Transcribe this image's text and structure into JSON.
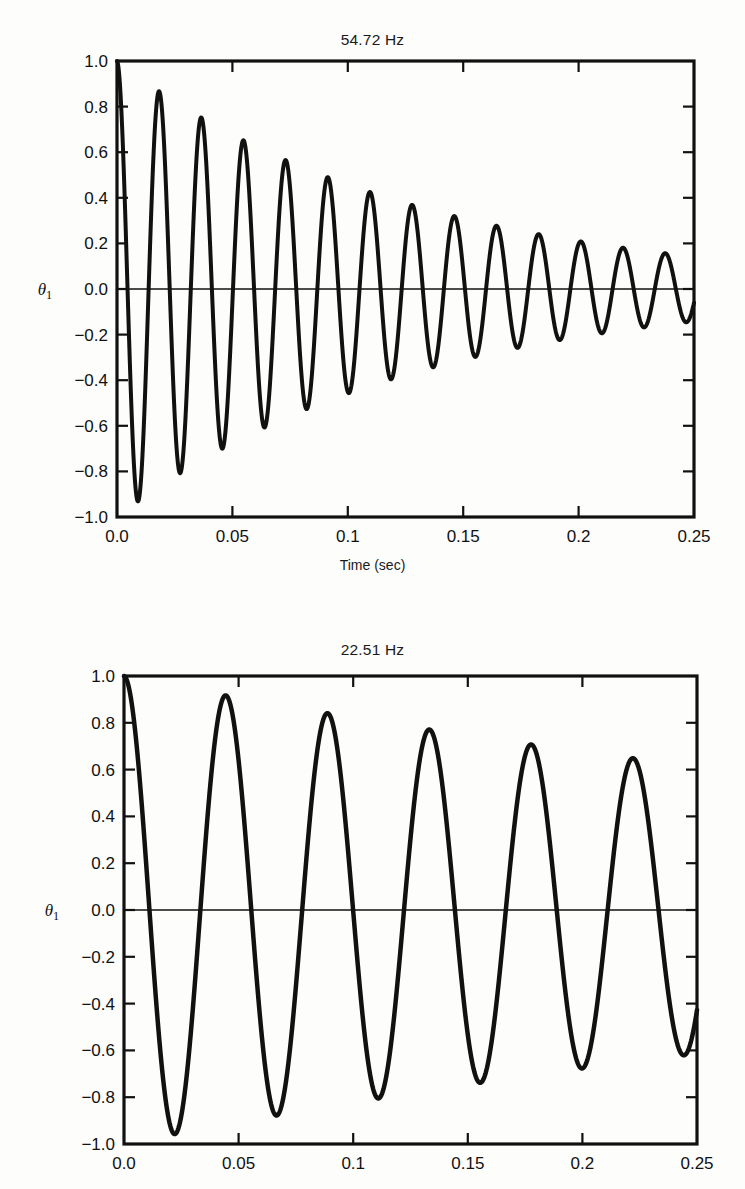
{
  "scan_header_text": "",
  "figures": [
    {
      "id": "figure-1",
      "title": "54.72 Hz",
      "ylabel": "θ₁",
      "xlabel": "Time (sec)",
      "show_xlabel": true
    },
    {
      "id": "figure-2",
      "title": "22.51 Hz",
      "ylabel": "θ₁",
      "xlabel": "",
      "show_xlabel": false
    }
  ],
  "chart_data": [
    {
      "type": "line",
      "title": "54.72 Hz",
      "xlabel": "Time (sec)",
      "ylabel": "θ₁",
      "xlim": [
        0.0,
        0.25
      ],
      "ylim": [
        -1.0,
        1.0
      ],
      "xticks": [
        0.0,
        0.05,
        0.1,
        0.15,
        0.2,
        0.25
      ],
      "xticklabels": [
        "0.0",
        "0.05",
        "0.1",
        "0.15",
        "0.2",
        "0.25"
      ],
      "yticks": [
        -1.0,
        -0.8,
        -0.6,
        -0.4,
        -0.2,
        0.0,
        0.2,
        0.4,
        0.6,
        0.8,
        1.0
      ],
      "yticklabels": [
        "−1.0",
        "−0.8",
        "−0.6",
        "−0.4",
        "−0.2",
        "0.0",
        "0.2",
        "0.4",
        "0.6",
        "0.8",
        "1.0"
      ],
      "grid": false,
      "legend": null,
      "zero_line": true,
      "line_color": "#111111",
      "line_width": 4,
      "model": {
        "description": "damped cosine oscillation",
        "frequency_hz": 54.72,
        "amplitude": 1.0,
        "decay_constant_per_sec": 7.8,
        "phase_rad": 0.0
      },
      "extrema": [
        {
          "t": 0.0,
          "value": 1.0
        },
        {
          "t": 0.009,
          "value": -0.87
        },
        {
          "t": 0.018,
          "value": 0.84
        },
        {
          "t": 0.027,
          "value": -0.79
        },
        {
          "t": 0.036,
          "value": 0.76
        },
        {
          "t": 0.046,
          "value": -0.72
        },
        {
          "t": 0.055,
          "value": 0.66
        },
        {
          "t": 0.064,
          "value": -0.67
        },
        {
          "t": 0.073,
          "value": 0.56
        },
        {
          "t": 0.082,
          "value": -0.55
        },
        {
          "t": 0.091,
          "value": 0.51
        },
        {
          "t": 0.1,
          "value": -0.49
        },
        {
          "t": 0.11,
          "value": 0.43
        },
        {
          "t": 0.119,
          "value": -0.45
        },
        {
          "t": 0.128,
          "value": 0.38
        },
        {
          "t": 0.137,
          "value": -0.37
        },
        {
          "t": 0.146,
          "value": 0.34
        },
        {
          "t": 0.155,
          "value": -0.33
        },
        {
          "t": 0.164,
          "value": 0.3
        },
        {
          "t": 0.174,
          "value": -0.29
        },
        {
          "t": 0.183,
          "value": 0.26
        },
        {
          "t": 0.192,
          "value": -0.25
        },
        {
          "t": 0.201,
          "value": 0.23
        },
        {
          "t": 0.21,
          "value": -0.21
        },
        {
          "t": 0.219,
          "value": 0.2
        },
        {
          "t": 0.228,
          "value": -0.19
        },
        {
          "t": 0.238,
          "value": 0.17
        },
        {
          "t": 0.247,
          "value": -0.15
        }
      ]
    },
    {
      "type": "line",
      "title": "22.51 Hz",
      "xlabel": "",
      "ylabel": "θ₁",
      "xlim": [
        0.0,
        0.25
      ],
      "ylim": [
        -1.0,
        1.0
      ],
      "xticks": [
        0.0,
        0.05,
        0.1,
        0.15,
        0.2,
        0.25
      ],
      "xticklabels": [
        "0.0",
        "0.05",
        "0.1",
        "0.15",
        "0.2",
        "0.25"
      ],
      "yticks": [
        -1.0,
        -0.8,
        -0.6,
        -0.4,
        -0.2,
        0.0,
        0.2,
        0.4,
        0.6,
        0.8,
        1.0
      ],
      "yticklabels": [
        "−1.0",
        "−0.8",
        "−0.6",
        "−0.4",
        "−0.2",
        "0.0",
        "0.2",
        "0.4",
        "0.6",
        "0.8",
        "1.0"
      ],
      "grid": false,
      "legend": null,
      "zero_line": true,
      "line_color": "#111111",
      "line_width": 4.5,
      "model": {
        "description": "lightly damped cosine oscillation",
        "frequency_hz": 22.51,
        "amplitude": 1.0,
        "decay_constant_per_sec": 1.95,
        "phase_rad": 0.0
      },
      "extrema": [
        {
          "t": 0.0,
          "value": 1.0
        },
        {
          "t": 0.022,
          "value": -0.94
        },
        {
          "t": 0.044,
          "value": 0.91
        },
        {
          "t": 0.066,
          "value": -0.87
        },
        {
          "t": 0.089,
          "value": 0.83
        },
        {
          "t": 0.111,
          "value": -0.79
        },
        {
          "t": 0.133,
          "value": 0.76
        },
        {
          "t": 0.155,
          "value": -0.71
        },
        {
          "t": 0.178,
          "value": 0.69
        },
        {
          "t": 0.2,
          "value": -0.65
        },
        {
          "t": 0.222,
          "value": 0.63
        },
        {
          "t": 0.244,
          "value": -0.6
        },
        {
          "t": 0.25,
          "value": -0.45
        }
      ]
    }
  ]
}
